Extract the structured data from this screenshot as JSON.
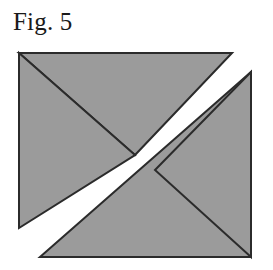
{
  "figure": {
    "caption": "Fig. 5",
    "background_color": "#ffffff",
    "fill_color": "#9b9b9b",
    "stroke_color": "#2b2b2b",
    "band_color": "#fdfdfb",
    "stroke_width": 2
  },
  "chart_data": {
    "type": "diagram",
    "title": "Fig. 5",
    "canvas": {
      "width": 273,
      "height": 270
    },
    "square": {
      "name": "outer-square",
      "corners": {
        "top_left": [
          19,
          53
        ],
        "top_right": [
          251,
          53
        ],
        "bottom_right": [
          251,
          257
        ],
        "bottom_left": [
          19,
          257
        ]
      },
      "width": 232,
      "height": 204
    },
    "diagonals": [
      {
        "name": "diagonal-tl-br",
        "from": [
          19,
          53
        ],
        "to": [
          251,
          257
        ]
      },
      {
        "name": "diagonal-bl-tr",
        "from": [
          19,
          257
        ],
        "to": [
          251,
          53
        ]
      }
    ],
    "center": [
      135,
      155
    ],
    "band": {
      "name": "white-diagonal-band",
      "direction": "lower-left to upper-right",
      "color": "#fdfdfb",
      "edge_upper": {
        "from": [
          19,
          228
        ],
        "to": [
          232,
          53
        ]
      },
      "edge_lower": {
        "from": [
          40,
          257
        ],
        "to": [
          251,
          72
        ]
      },
      "perpendicular_width": 21
    },
    "regions": [
      {
        "name": "upper-left-triangle",
        "vertices": [
          [
            19,
            53
          ],
          [
            232,
            53
          ],
          [
            135,
            155
          ]
        ],
        "fill": "#9b9b9b"
      },
      {
        "name": "left-triangle",
        "vertices": [
          [
            19,
            53
          ],
          [
            135,
            155
          ],
          [
            19,
            228
          ]
        ],
        "fill": "#9b9b9b"
      },
      {
        "name": "lower-right-triangle",
        "vertices": [
          [
            40,
            257
          ],
          [
            251,
            257
          ],
          [
            251,
            72
          ]
        ],
        "fill": "#9b9b9b"
      },
      {
        "name": "right-triangle",
        "vertices": [
          [
            251,
            72
          ],
          [
            251,
            257
          ],
          [
            155,
            170
          ]
        ],
        "fill": "#9b9b9b"
      }
    ]
  }
}
